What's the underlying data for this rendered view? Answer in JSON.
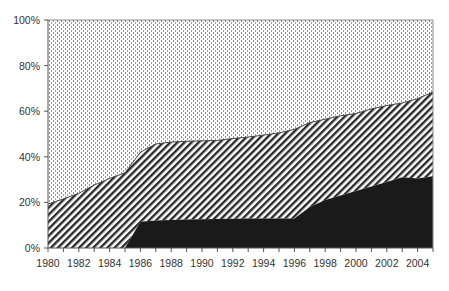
{
  "chart_data": {
    "type": "area",
    "stacked": true,
    "percent": true,
    "title": "",
    "xlabel": "",
    "ylabel": "",
    "x": [
      1980,
      1981,
      1982,
      1983,
      1984,
      1985,
      1986,
      1987,
      1988,
      1989,
      1990,
      1991,
      1992,
      1993,
      1994,
      1995,
      1996,
      1997,
      1998,
      1999,
      2000,
      2001,
      2002,
      2003,
      2004,
      2005
    ],
    "boundaries": {
      "bottom_top": [
        0,
        0,
        0,
        0,
        0,
        0,
        11.5,
        12,
        12.3,
        12.5,
        12.6,
        12.7,
        12.8,
        13,
        13,
        13,
        13,
        18,
        21,
        23,
        25,
        27,
        29,
        31,
        30.5,
        31.5
      ],
      "middle_top": [
        19.3,
        21.5,
        24,
        27.6,
        30.5,
        33,
        42,
        45.6,
        46.5,
        46.8,
        47,
        47.2,
        48,
        48.7,
        49.5,
        50.5,
        52,
        55,
        56.5,
        58,
        59,
        61,
        62.5,
        63.6,
        65.5,
        68.4
      ]
    },
    "series": [
      {
        "name": "Bottom (solid black)",
        "pattern": "solid",
        "values": [
          0,
          0,
          0,
          0,
          0,
          0,
          11.5,
          12,
          12.3,
          12.5,
          12.6,
          12.7,
          12.8,
          13,
          13,
          13,
          13,
          18,
          21,
          23,
          25,
          27,
          29,
          31,
          30.5,
          31.5
        ]
      },
      {
        "name": "Middle (diagonal hatch)",
        "pattern": "diagonal",
        "values": [
          19.3,
          21.5,
          24,
          27.6,
          30.5,
          33,
          30.5,
          33.6,
          34.2,
          34.3,
          34.4,
          34.5,
          35.2,
          35.7,
          36.5,
          37.5,
          39,
          37,
          35.5,
          35,
          34,
          34,
          33.5,
          32.6,
          35,
          36.9
        ]
      },
      {
        "name": "Top (dotted)",
        "pattern": "dotted",
        "values": [
          80.7,
          78.5,
          76,
          72.4,
          69.5,
          67,
          58,
          54.4,
          53.5,
          53.2,
          53,
          52.8,
          52,
          51.3,
          50.5,
          49.5,
          48,
          45,
          43.5,
          42,
          41,
          39,
          37.5,
          36.4,
          34.5,
          31.6
        ]
      }
    ],
    "y_ticks": [
      "0%",
      "20%",
      "40%",
      "60%",
      "80%",
      "100%"
    ],
    "y_tick_values": [
      0,
      20,
      40,
      60,
      80,
      100
    ],
    "x_tick_labels": [
      "1980",
      "1982",
      "1984",
      "1986",
      "1988",
      "1990",
      "1992",
      "1994",
      "1996",
      "1998",
      "2000",
      "2002",
      "2004"
    ],
    "ylim": [
      0,
      100
    ],
    "xlim": [
      1980,
      2005
    ],
    "grid": false,
    "legend": "none",
    "colors": {
      "solid": "#1a1a1a",
      "hatch": "#2a2a2a",
      "dots": "#8a8a8a",
      "axis": "#555555"
    }
  }
}
